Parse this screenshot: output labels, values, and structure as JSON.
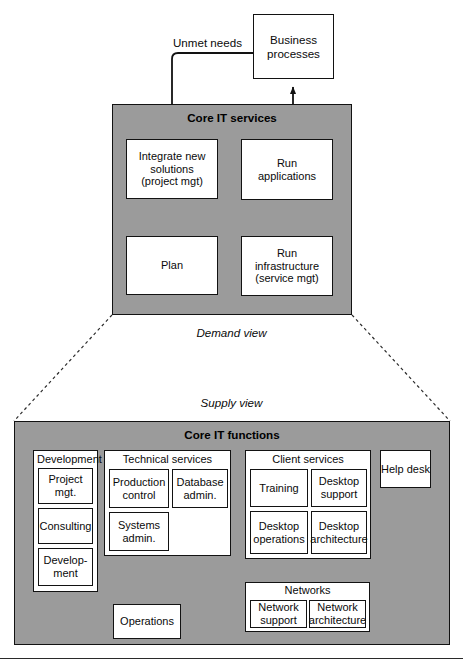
{
  "diagram": {
    "colors": {
      "zone_fill": "#9b9b9b",
      "box_fill": "#ffffff",
      "stroke": "#121212",
      "text": "#0a0a0a"
    },
    "top": {
      "business_processes": "Business\nprocesses",
      "business_processes_line1": "Business",
      "business_processes_line2": "processes",
      "unmet_needs_label": "Unmet needs",
      "zone_title": "Core IT services",
      "boxes": {
        "integrate": {
          "line1": "Integrate new",
          "line2": "solutions",
          "line3": "(project mgt)"
        },
        "run_applications": {
          "line1": "Run",
          "line2": "applications"
        },
        "plan": {
          "line1": "Plan"
        },
        "run_infrastructure": {
          "line1": "Run",
          "line2": "infrastructure",
          "line3": "(service mgt)"
        }
      }
    },
    "views": {
      "demand": "Demand view",
      "supply": "Supply view"
    },
    "bottom": {
      "zone_title": "Core IT functions",
      "groups": [
        {
          "name": "development",
          "title": "Development",
          "title_align": "left",
          "items": [
            {
              "name": "project-mgt",
              "line1": "Project",
              "line2": "mgt."
            },
            {
              "name": "consulting",
              "line1": "Consulting",
              "line2": ""
            },
            {
              "name": "development",
              "line1": "Develop-",
              "line2": "ment"
            }
          ]
        },
        {
          "name": "technical-services",
          "title": "Technical services",
          "title_align": "center",
          "items": [
            {
              "name": "production-control",
              "line1": "Production",
              "line2": "control"
            },
            {
              "name": "database-admin",
              "line1": "Database",
              "line2": "admin."
            },
            {
              "name": "systems-admin",
              "line1": "Systems",
              "line2": "admin."
            }
          ]
        },
        {
          "name": "client-services",
          "title": "Client services",
          "title_align": "center",
          "items": [
            {
              "name": "training",
              "line1": "Training",
              "line2": ""
            },
            {
              "name": "desktop-support",
              "line1": "Desktop",
              "line2": "support"
            },
            {
              "name": "desktop-operations",
              "line1": "Desktop",
              "line2": "operations"
            },
            {
              "name": "desktop-architecture",
              "line1": "Desktop",
              "line2": "architecture"
            }
          ]
        },
        {
          "name": "networks",
          "title": "Networks",
          "title_align": "center",
          "items": [
            {
              "name": "network-support",
              "line1": "Network",
              "line2": "support"
            },
            {
              "name": "network-architecture",
              "line1": "Network",
              "line2": "architecture"
            }
          ]
        }
      ],
      "standalone": [
        {
          "name": "help-desk",
          "label": "Help desk"
        },
        {
          "name": "operations",
          "label": "Operations"
        }
      ]
    }
  }
}
